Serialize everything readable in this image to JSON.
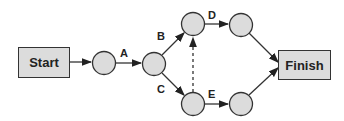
{
  "diagram": {
    "type": "activity-network",
    "start_label": "Start",
    "finish_label": "Finish",
    "colors": {
      "node_fill": "#dcdcdc",
      "stroke": "#333333"
    },
    "nodes": [
      {
        "id": "n1",
        "cx": 104,
        "cy": 63
      },
      {
        "id": "n2",
        "cx": 154,
        "cy": 64
      },
      {
        "id": "n3",
        "cx": 193,
        "cy": 24
      },
      {
        "id": "n4",
        "cx": 241,
        "cy": 25
      },
      {
        "id": "n5",
        "cx": 193,
        "cy": 104
      },
      {
        "id": "n6",
        "cx": 241,
        "cy": 104
      }
    ],
    "edges": [
      {
        "from": "start",
        "to": "n1",
        "label": ""
      },
      {
        "from": "n1",
        "to": "n2",
        "label": "A"
      },
      {
        "from": "n2",
        "to": "n3",
        "label": "B"
      },
      {
        "from": "n2",
        "to": "n5",
        "label": "C"
      },
      {
        "from": "n3",
        "to": "n4",
        "label": "D"
      },
      {
        "from": "n5",
        "to": "n6",
        "label": "E"
      },
      {
        "from": "n5",
        "to": "n3",
        "label": "",
        "style": "dashed"
      },
      {
        "from": "n4",
        "to": "finish",
        "label": ""
      },
      {
        "from": "n6",
        "to": "finish",
        "label": ""
      }
    ],
    "edge_labels": {
      "A": "A",
      "B": "B",
      "C": "C",
      "D": "D",
      "E": "E"
    }
  }
}
